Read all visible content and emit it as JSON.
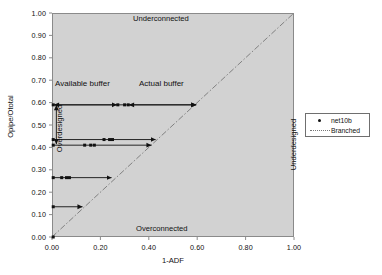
{
  "chart_data": {
    "type": "scatter",
    "title": "",
    "xlabel": "1-ADF",
    "ylabel": "Opipe/Ototal",
    "xlim": [
      0.0,
      1.0
    ],
    "ylim": [
      0.0,
      1.0
    ],
    "xticks": [
      "0.00",
      "0.20",
      "0.40",
      "0.60",
      "0.80",
      "1.00"
    ],
    "xtick_values": [
      0.0,
      0.2,
      0.4,
      0.6,
      0.8,
      1.0
    ],
    "yticks": [
      "0.00",
      "0.10",
      "0.20",
      "0.30",
      "0.40",
      "0.50",
      "0.60",
      "0.70",
      "0.80",
      "0.90",
      "1.00"
    ],
    "ytick_values": [
      0.0,
      0.1,
      0.2,
      0.3,
      0.4,
      0.5,
      0.6,
      0.7,
      0.8,
      0.9,
      1.0
    ],
    "grid": false,
    "plot_background": "#d2d2d2",
    "marker_color": "#111111",
    "line_color": "#777777",
    "legend_position": "right-outside",
    "legend": [
      {
        "label": "net10b",
        "style": "marker"
      },
      {
        "label": "Branched",
        "style": "dotted-line"
      }
    ],
    "reference_line": {
      "name": "Branched",
      "style": "dash-dot",
      "from": [
        0.0,
        0.0
      ],
      "to": [
        1.0,
        1.0
      ]
    },
    "series": [
      {
        "name": "net10b",
        "points": [
          [
            0.005,
            0.59
          ],
          [
            0.272,
            0.59
          ],
          [
            0.3,
            0.59
          ],
          [
            0.315,
            0.59
          ],
          [
            0.6,
            0.59
          ],
          [
            0.005,
            0.435
          ],
          [
            0.215,
            0.435
          ],
          [
            0.238,
            0.435
          ],
          [
            0.25,
            0.435
          ],
          [
            0.432,
            0.435
          ],
          [
            0.005,
            0.41
          ],
          [
            0.135,
            0.41
          ],
          [
            0.16,
            0.41
          ],
          [
            0.175,
            0.41
          ],
          [
            0.415,
            0.41
          ],
          [
            0.005,
            0.265
          ],
          [
            0.04,
            0.265
          ],
          [
            0.06,
            0.265
          ],
          [
            0.072,
            0.265
          ],
          [
            0.25,
            0.265
          ],
          [
            0.005,
            0.135
          ],
          [
            0.13,
            0.135
          ],
          [
            0.005,
            0.0
          ]
        ]
      }
    ],
    "arrow_rows": [
      {
        "y": 0.59,
        "x_start": 0.005,
        "x_end": 0.6,
        "markers": [
          0.005,
          0.272,
          0.3,
          0.315
        ]
      },
      {
        "y": 0.435,
        "x_start": 0.005,
        "x_end": 0.432,
        "markers": [
          0.005,
          0.215,
          0.238,
          0.25
        ]
      },
      {
        "y": 0.41,
        "x_start": 0.005,
        "x_end": 0.415,
        "markers": [
          0.005,
          0.135,
          0.16,
          0.175
        ]
      },
      {
        "y": 0.265,
        "x_start": 0.005,
        "x_end": 0.25,
        "markers": [
          0.005,
          0.04,
          0.06,
          0.072
        ]
      },
      {
        "y": 0.135,
        "x_start": 0.005,
        "x_end": 0.13,
        "markers": [
          0.005
        ]
      }
    ],
    "annotations": [
      {
        "text": "Underconnected",
        "x": 0.34,
        "y": 0.975,
        "rotation": 0
      },
      {
        "text": "Overconnected",
        "x": 0.35,
        "y": 0.055,
        "rotation": 0
      },
      {
        "text": "Underdesigned",
        "x": 0.935,
        "y": 0.44,
        "rotation": -90
      },
      {
        "text": "Overdesigned",
        "x": 0.035,
        "y": 0.5,
        "rotation": -90
      },
      {
        "text": "Available buffer",
        "x": 0.03,
        "y": 0.655,
        "rotation": 0
      },
      {
        "text": "Actual buffer",
        "x": 0.38,
        "y": 0.655,
        "rotation": 0
      }
    ]
  },
  "axis": {
    "x_label": "1-ADF",
    "y_label": "Opipe/Ototal"
  },
  "zones": {
    "underconnected": "Underconnected",
    "overconnected": "Overconnected",
    "underdesigned": "Underdesigned",
    "overdesigned": "Overdesigned"
  },
  "annotations": {
    "available_buffer": "Available buffer",
    "actual_buffer": "Actual buffer"
  },
  "legend": {
    "items": [
      {
        "label": "net10b"
      },
      {
        "label": "Branched"
      }
    ]
  }
}
